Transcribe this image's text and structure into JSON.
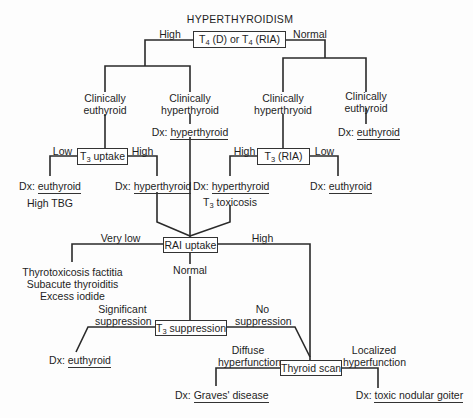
{
  "title": "HYPERTHYROIDISM",
  "nodes": {
    "t4": {
      "pre": "T",
      "sub1": "4",
      "mid": " (D) or T",
      "sub2": "4",
      "post": " (RIA)"
    },
    "t3_uptake": {
      "pre": "T",
      "sub": "3",
      "post": " uptake"
    },
    "t3_ria": {
      "pre": "T",
      "sub": "3",
      "post": " (RIA)"
    },
    "rai_uptake": "RAI uptake",
    "t3_suppression": {
      "pre": "T",
      "sub": "3",
      "post": " suppression"
    },
    "thyroid_scan": "Thyroid scan"
  },
  "edges": {
    "t4_high": "High",
    "t4_normal": "Normal",
    "t3u_low": "Low",
    "t3u_high": "High",
    "t3r_high": "High",
    "t3r_low": "Low",
    "rai_very_low": "Very low",
    "rai_high": "High",
    "rai_normal": "Normal",
    "sig_supp_1": "Significant",
    "sig_supp_2": "suppression",
    "no_supp_1": "No",
    "no_supp_2": "suppression",
    "diffuse_1": "Diffuse",
    "diffuse_2": "hyperfunction",
    "localized_1": "Localized",
    "localized_2": "hyperfunction"
  },
  "states": {
    "left_euthyroid_1": "Clinically",
    "left_euthyroid_2": "euthyroid",
    "left_hyper_1": "Clinically",
    "left_hyper_2": "hyperthyroid",
    "right_hyper_1": "Clinically",
    "right_hyper_2": "hyperthryoid",
    "right_euthyroid_1": "Clinically",
    "right_euthyroid_2": "euthyroid"
  },
  "diagnoses": {
    "dx_prefix": "Dx: ",
    "left_hyper": "hyperthyroid",
    "right_euthyroid": "euthyroid",
    "t3u_low": "euthyroid",
    "t3u_low_note": "High TBG",
    "t3u_high": "hyperthyroid",
    "t3r_high": "hyperthyroid",
    "t3r_high_note": {
      "pre": "T",
      "sub": "3",
      "post": " toxicosis"
    },
    "t3r_low": "euthyroid",
    "very_low_list": [
      "Thyrotoxicosis factitia",
      "Subacute thyroiditis",
      "Excess iodide"
    ],
    "sig_supp": "euthyroid",
    "graves": "Graves' disease",
    "toxic_nodular": "toxic nodular goiter"
  },
  "colors": {
    "line": "#2a2a2a",
    "text": "#1e1e1e",
    "background": "#fdfdfd"
  }
}
